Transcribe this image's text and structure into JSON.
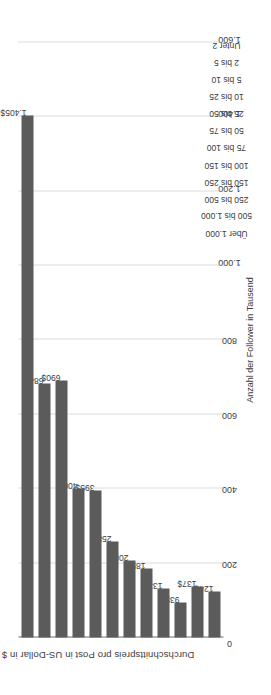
{
  "chart_data": {
    "type": "bar",
    "orientation": "vertical-bars-rotated",
    "title": "",
    "xlabel": "Anzahl der Follower in Tausend",
    "ylabel": "Durchschnittspreis pro Post in US-Dollar in $",
    "ylim": [
      0,
      1600
    ],
    "ytick_values": [
      0,
      200,
      400,
      600,
      800,
      1000,
      1200,
      1400,
      1600
    ],
    "ytick_labels": [
      "0",
      "200",
      "400",
      "600",
      "800",
      "1.000",
      "1.200",
      "1.400",
      "1.600"
    ],
    "grid": true,
    "legend": null,
    "bar_color": "#5b5b5b",
    "categories": [
      "Unter 2",
      "2 bis 5",
      "5 bis 10",
      "10 bis 25",
      "25 bis 50",
      "50 bis 75",
      "75 bis 100",
      "100 bis 150",
      "150 bis 250",
      "250 bis 500",
      "500 bis 1.000",
      "Über 1.000"
    ],
    "values": [
      124,
      137,
      93,
      133,
      185,
      208,
      258,
      395,
      400,
      690,
      684,
      1405
    ],
    "data_labels": [
      "124$",
      "137$",
      "93$",
      "133$",
      "185$",
      "208$",
      "258$",
      "395$",
      "400$",
      "690$",
      "684$",
      "1.405$"
    ]
  }
}
